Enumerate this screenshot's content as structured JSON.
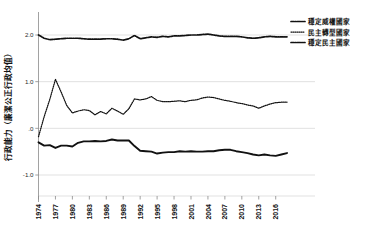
{
  "chart_data": {
    "type": "line",
    "title": "",
    "xlabel": "",
    "ylabel": "行政能力（廉潔公正行政均值）",
    "ylim": [
      -1.45,
      2.45
    ],
    "xlim": [
      1974,
      2018
    ],
    "yticks": [
      "2.0",
      "1.0",
      ".0",
      "-1.0"
    ],
    "ytick_values": [
      2.0,
      1.0,
      0.0,
      -1.0
    ],
    "grid": true,
    "legend_position": "top-right",
    "x": [
      1974,
      1975,
      1976,
      1977,
      1978,
      1979,
      1980,
      1981,
      1982,
      1983,
      1984,
      1985,
      1986,
      1987,
      1988,
      1989,
      1990,
      1991,
      1992,
      1993,
      1994,
      1995,
      1996,
      1997,
      1998,
      1999,
      2000,
      2001,
      2002,
      2003,
      2004,
      2005,
      2006,
      2007,
      2008,
      2009,
      2010,
      2011,
      2012,
      2013,
      2014,
      2015,
      2016,
      2017,
      2018
    ],
    "xticks": [
      "1974",
      "1977",
      "1980",
      "1983",
      "1986",
      "1989",
      "1992",
      "1995",
      "1998",
      "2001",
      "2004",
      "2007",
      "2010",
      "2013",
      "2016"
    ],
    "xtick_values": [
      1974,
      1977,
      1980,
      1983,
      1986,
      1989,
      1992,
      1995,
      1998,
      2001,
      2004,
      2007,
      2010,
      2013,
      2016
    ],
    "series": [
      {
        "name": "穩定威權國家",
        "style": "dashdot",
        "legend_key": "stable-authoritarian",
        "values": [
          2.0,
          1.93,
          1.9,
          1.91,
          1.92,
          1.93,
          1.93,
          1.93,
          1.92,
          1.91,
          1.91,
          1.91,
          1.92,
          1.92,
          1.91,
          1.89,
          1.92,
          1.99,
          1.92,
          1.94,
          1.96,
          1.95,
          1.97,
          1.96,
          1.98,
          1.98,
          1.99,
          2.0,
          2.0,
          2.01,
          2.02,
          2.0,
          1.98,
          1.97,
          1.97,
          1.97,
          1.96,
          1.94,
          1.93,
          1.94,
          1.96,
          1.97,
          1.96,
          1.96,
          1.96
        ]
      },
      {
        "name": "民主轉型國家",
        "style": "dotted",
        "legend_key": "democratizing",
        "values": [
          -0.18,
          0.25,
          0.62,
          1.05,
          0.78,
          0.49,
          0.33,
          0.37,
          0.4,
          0.38,
          0.29,
          0.36,
          0.31,
          0.43,
          0.37,
          0.3,
          0.42,
          0.63,
          0.61,
          0.63,
          0.68,
          0.6,
          0.57,
          0.57,
          0.58,
          0.59,
          0.57,
          0.6,
          0.61,
          0.65,
          0.67,
          0.66,
          0.63,
          0.6,
          0.58,
          0.55,
          0.53,
          0.5,
          0.48,
          0.43,
          0.48,
          0.52,
          0.55,
          0.56,
          0.56
        ]
      },
      {
        "name": "穩定民主國家",
        "style": "solid",
        "legend_key": "stable-democracy",
        "values": [
          -0.3,
          -0.37,
          -0.36,
          -0.42,
          -0.37,
          -0.37,
          -0.39,
          -0.31,
          -0.28,
          -0.28,
          -0.27,
          -0.28,
          -0.27,
          -0.24,
          -0.26,
          -0.26,
          -0.26,
          -0.38,
          -0.48,
          -0.49,
          -0.5,
          -0.54,
          -0.52,
          -0.51,
          -0.51,
          -0.49,
          -0.5,
          -0.49,
          -0.5,
          -0.5,
          -0.49,
          -0.49,
          -0.47,
          -0.46,
          -0.46,
          -0.49,
          -0.51,
          -0.53,
          -0.56,
          -0.58,
          -0.56,
          -0.58,
          -0.59,
          -0.56,
          -0.53
        ]
      }
    ]
  },
  "legend": {
    "items": [
      {
        "label": "穩定威權國家",
        "style": "dashdot"
      },
      {
        "label": "民主轉型國家",
        "style": "dotted"
      },
      {
        "label": "穩定民主國家",
        "style": "dashdot"
      }
    ]
  },
  "colors": {
    "ink": "#111111",
    "grid": "#d9d9d9",
    "axis": "#8a8a8a",
    "background": "#ffffff"
  }
}
